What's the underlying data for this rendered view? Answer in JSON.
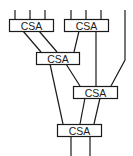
{
  "diagram": {
    "title": "",
    "node_label": "CSA",
    "nodes": [
      {
        "id": "csa1",
        "label": "CSA",
        "x": 9,
        "y": 19,
        "w": 44,
        "h": 12
      },
      {
        "id": "csa2",
        "label": "CSA",
        "x": 64,
        "y": 19,
        "w": 44,
        "h": 12
      },
      {
        "id": "csa3",
        "label": "CSA",
        "x": 36,
        "y": 52,
        "w": 43,
        "h": 12
      },
      {
        "id": "csa4",
        "label": "CSA",
        "x": 73,
        "y": 86,
        "w": 44,
        "h": 12
      },
      {
        "id": "csa5",
        "label": "CSA",
        "x": 57,
        "y": 124,
        "w": 44,
        "h": 12
      }
    ],
    "colors": {
      "stroke": "#1a1a1a",
      "background": "#ffffff"
    }
  }
}
